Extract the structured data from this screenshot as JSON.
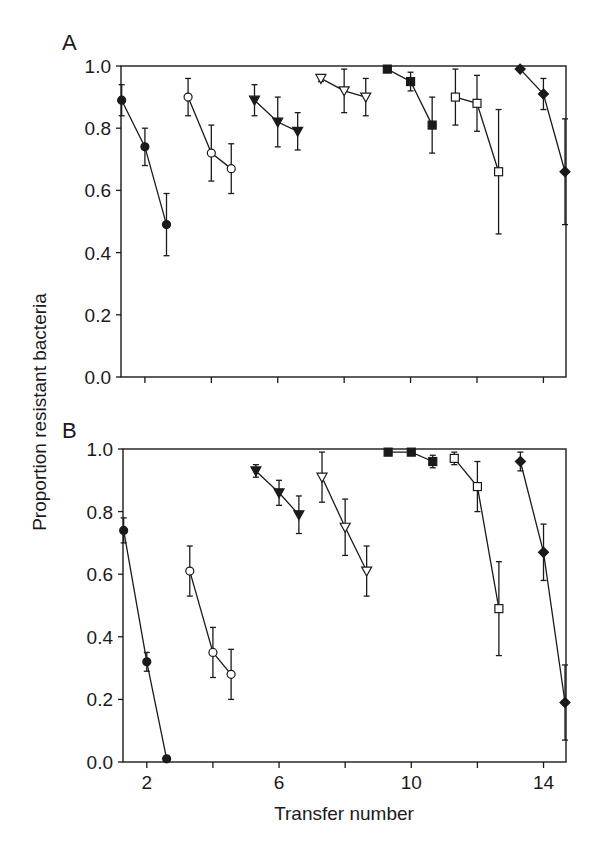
{
  "chart_data": [
    {
      "type": "line",
      "panel": "A",
      "title": "A",
      "xlabel": "Transfer number",
      "ylabel": "Proportion resistant bacteria",
      "xlim": [
        1.28,
        14.68
      ],
      "ylim": [
        0.0,
        1.0
      ],
      "xticks": [
        2,
        4,
        6,
        8,
        10,
        12,
        14
      ],
      "xtick_labels": [
        "2",
        "",
        "6",
        "",
        "10",
        "",
        "14"
      ],
      "yticks": [
        0.0,
        0.2,
        0.4,
        0.6,
        0.8,
        1.0
      ],
      "ytick_labels": [
        "0.0",
        "0.2",
        "0.4",
        "0.6",
        "0.8",
        "1.0"
      ],
      "grid": false,
      "series": [
        {
          "name": "filled-circle",
          "marker": "circle",
          "filled": true,
          "x": [
            1.3,
            2.0,
            2.65
          ],
          "y": [
            0.89,
            0.74,
            0.49
          ],
          "err": [
            0.05,
            0.06,
            0.1
          ]
        },
        {
          "name": "open-circle",
          "marker": "circle",
          "filled": false,
          "x": [
            3.3,
            4.0,
            4.6
          ],
          "y": [
            0.9,
            0.72,
            0.67
          ],
          "err": [
            0.06,
            0.09,
            0.08
          ]
        },
        {
          "name": "filled-triangle-down",
          "marker": "triangle-down",
          "filled": true,
          "x": [
            5.3,
            6.0,
            6.6
          ],
          "y": [
            0.89,
            0.82,
            0.79
          ],
          "err": [
            0.05,
            0.08,
            0.06
          ]
        },
        {
          "name": "open-triangle-down",
          "marker": "triangle-down",
          "filled": false,
          "x": [
            7.3,
            8.0,
            8.65
          ],
          "y": [
            0.96,
            0.92,
            0.9
          ],
          "err": [
            0.01,
            0.07,
            0.06
          ]
        },
        {
          "name": "filled-square",
          "marker": "square",
          "filled": true,
          "x": [
            9.3,
            10.0,
            10.65
          ],
          "y": [
            0.99,
            0.95,
            0.81
          ],
          "err": [
            0.0,
            0.03,
            0.09
          ]
        },
        {
          "name": "open-square",
          "marker": "square",
          "filled": false,
          "x": [
            11.35,
            12.0,
            12.65
          ],
          "y": [
            0.9,
            0.88,
            0.66
          ],
          "err": [
            0.09,
            0.09,
            0.2
          ]
        },
        {
          "name": "filled-diamond",
          "marker": "diamond",
          "filled": true,
          "x": [
            13.3,
            14.0,
            14.65
          ],
          "y": [
            0.99,
            0.91,
            0.66
          ],
          "err": [
            0.0,
            0.05,
            0.17
          ]
        }
      ]
    },
    {
      "type": "line",
      "panel": "B",
      "title": "B",
      "xlabel": "Transfer number",
      "ylabel": "Proportion resistant bacteria",
      "xlim": [
        1.28,
        14.68
      ],
      "ylim": [
        0.0,
        1.0
      ],
      "xticks": [
        2,
        4,
        6,
        8,
        10,
        12,
        14
      ],
      "xtick_labels": [
        "2",
        "",
        "6",
        "",
        "10",
        "",
        "14"
      ],
      "yticks": [
        0.0,
        0.2,
        0.4,
        0.6,
        0.8,
        1.0
      ],
      "ytick_labels": [
        "0.0",
        "0.2",
        "0.4",
        "0.6",
        "0.8",
        "1.0"
      ],
      "grid": false,
      "series": [
        {
          "name": "filled-circle",
          "marker": "circle",
          "filled": true,
          "x": [
            1.3,
            2.0,
            2.6
          ],
          "y": [
            0.74,
            0.32,
            0.01
          ],
          "err": [
            0.04,
            0.03,
            0.0
          ]
        },
        {
          "name": "open-circle",
          "marker": "circle",
          "filled": false,
          "x": [
            3.3,
            4.0,
            4.55
          ],
          "y": [
            0.61,
            0.35,
            0.28
          ],
          "err": [
            0.08,
            0.08,
            0.08
          ]
        },
        {
          "name": "filled-triangle-down",
          "marker": "triangle-down",
          "filled": true,
          "x": [
            5.3,
            6.0,
            6.6
          ],
          "y": [
            0.93,
            0.86,
            0.79
          ],
          "err": [
            0.02,
            0.04,
            0.06
          ]
        },
        {
          "name": "open-triangle-down",
          "marker": "triangle-down",
          "filled": false,
          "x": [
            7.3,
            8.0,
            8.65
          ],
          "y": [
            0.91,
            0.75,
            0.61
          ],
          "err": [
            0.08,
            0.09,
            0.08
          ]
        },
        {
          "name": "filled-square",
          "marker": "square",
          "filled": true,
          "x": [
            9.3,
            10.0,
            10.65
          ],
          "y": [
            0.99,
            0.99,
            0.96
          ],
          "err": [
            0.0,
            0.0,
            0.02
          ]
        },
        {
          "name": "open-square",
          "marker": "square",
          "filled": false,
          "x": [
            11.3,
            12.0,
            12.65
          ],
          "y": [
            0.97,
            0.88,
            0.49
          ],
          "err": [
            0.02,
            0.08,
            0.15
          ]
        },
        {
          "name": "filled-diamond",
          "marker": "diamond",
          "filled": true,
          "x": [
            13.3,
            14.0,
            14.65
          ],
          "y": [
            0.96,
            0.67,
            0.19
          ],
          "err": [
            0.03,
            0.09,
            0.12
          ]
        }
      ]
    }
  ],
  "labels": {
    "panel_a": "A",
    "panel_b": "B",
    "ylabel": "Proportion resistant bacteria",
    "xlabel": "Transfer number"
  },
  "colors": {
    "ink": "#1a1a1a",
    "background": "#ffffff"
  }
}
